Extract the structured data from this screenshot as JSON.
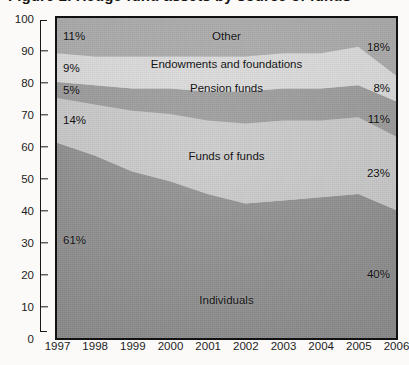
{
  "title": "Figure 2. Hedge fund assets by source of funds",
  "title_note": "cropped-at-top-edge",
  "chart_data": {
    "type": "area",
    "stacked": true,
    "title": "Figure 2. Hedge fund assets by source of funds",
    "xlabel": "",
    "ylabel": "",
    "x": [
      "1997",
      "1998",
      "1999",
      "2000",
      "2001",
      "2002",
      "2003",
      "2004",
      "2005",
      "2006"
    ],
    "xtick_labels": [
      "1997",
      "1998",
      "1999",
      "2000",
      "2001",
      "2002",
      "2003",
      "2004",
      "2005",
      "2006"
    ],
    "ylim": [
      0,
      100
    ],
    "ytick_labels": [
      "0",
      "10",
      "20",
      "30",
      "40",
      "50",
      "60",
      "70",
      "80",
      "90",
      "100"
    ],
    "yticks": [
      0,
      10,
      20,
      30,
      40,
      50,
      60,
      70,
      80,
      90,
      100
    ],
    "grid": false,
    "legend_position": "in-band-labels",
    "units": "percent",
    "series": [
      {
        "name": "Individuals",
        "color": "#8d8d8d",
        "stack_order": 1,
        "values": [
          61,
          57,
          52,
          49,
          45,
          42,
          43,
          44,
          45,
          40
        ],
        "label_start": "61%",
        "label_end": "40%"
      },
      {
        "name": "Funds of funds",
        "color": "#c9c9c9",
        "stack_order": 2,
        "values": [
          14,
          16,
          19,
          21,
          23,
          25,
          25,
          24,
          24,
          23
        ],
        "label_start": "14%",
        "label_end": "23%"
      },
      {
        "name": "Pension funds",
        "color": "#9a9a9a",
        "stack_order": 3,
        "values": [
          5,
          6,
          7,
          8,
          9,
          10,
          10,
          10,
          10,
          11
        ],
        "label_start": "5%",
        "label_end": "11%"
      },
      {
        "name": "Endowments and foundations",
        "color": "#dcdcdc",
        "stack_order": 4,
        "values": [
          9,
          9,
          10,
          10,
          11,
          11,
          11,
          11,
          12,
          8
        ],
        "label_start": "9%",
        "label_end": "8%"
      },
      {
        "name": "Other",
        "color": "#ababab",
        "stack_order": 5,
        "values": [
          11,
          12,
          12,
          12,
          12,
          12,
          11,
          11,
          9,
          18
        ],
        "label_start": "11%",
        "label_end": "18%"
      }
    ]
  },
  "annotations": {
    "band_labels": [
      {
        "text": "Other",
        "series": "Other"
      },
      {
        "text": "Endowments and foundations",
        "series": "Endowments and foundations"
      },
      {
        "text": "Pension funds",
        "series": "Pension funds"
      },
      {
        "text": "Funds of funds",
        "series": "Funds of funds"
      },
      {
        "text": "Individuals",
        "series": "Individuals"
      }
    ]
  }
}
